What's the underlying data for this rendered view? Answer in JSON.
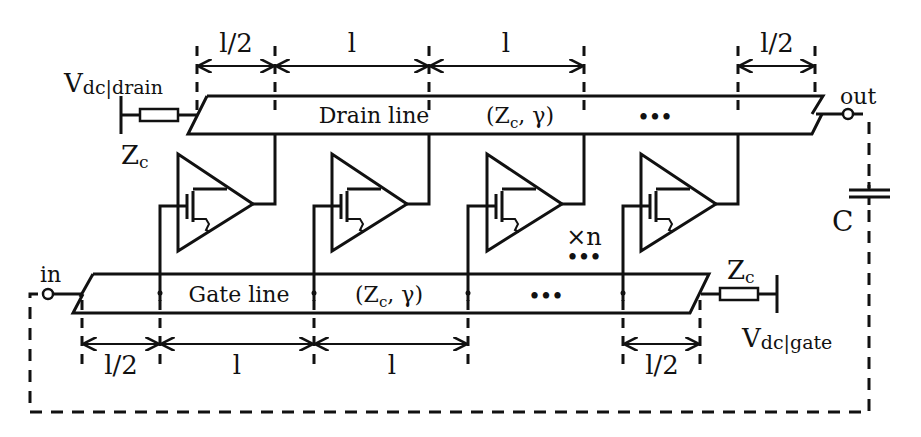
{
  "diagram": {
    "labels": {
      "vdc_drain_main": "V",
      "vdc_drain_sub": "dc|drain",
      "zc_drain": "Z",
      "zc_drain_sub": "c",
      "drain_line": "Drain line",
      "drain_params": "(Z",
      "drain_params_sub": "c",
      "drain_params_rest": ", γ)",
      "drain_ellipsis": "•••",
      "out": "out",
      "capacitor": "C",
      "multiplier": "×n",
      "stage_ellipsis": "•••",
      "in": "in",
      "gate_line": "Gate line",
      "gate_params": "(Z",
      "gate_params_sub": "c",
      "gate_params_rest": ", γ)",
      "gate_ellipsis": "•••",
      "zc_gate": "Z",
      "zc_gate_sub": "c",
      "vdc_gate_main": "V",
      "vdc_gate_sub": "dc|gate"
    },
    "top_dimensions": [
      "l/2",
      "l",
      "l",
      "l/2"
    ],
    "bottom_dimensions": [
      "l/2",
      "l",
      "l",
      "l/2"
    ],
    "stages": 4
  }
}
